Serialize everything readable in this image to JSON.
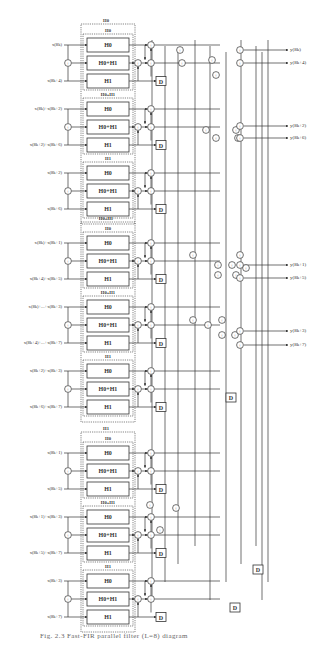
{
  "figure": {
    "caption": "Fig. 2.3   Fast-FIR parallel filter (L=8) diagram",
    "super_groups": [
      {
        "label": "H0",
        "sub_groups": [
          {
            "label": "H0",
            "inputs": [
              "x(8k)",
              "x(8k+4)"
            ],
            "boxes": [
              "H0",
              "H0+H1",
              "H1"
            ]
          },
          {
            "label": "H0+H1",
            "inputs": [
              "x(8k)+x(8k+2)",
              "x(8k+2)+x(8k+6)"
            ],
            "boxes": [
              "H0",
              "H0+H1",
              "H1"
            ]
          },
          {
            "label": "H1",
            "inputs": [
              "x(8k+2)",
              "x(8k+6)"
            ],
            "boxes": [
              "H0",
              "H0+H1",
              "H1"
            ]
          }
        ]
      },
      {
        "label": "H0+H1",
        "sub_groups": [
          {
            "label": "H0",
            "inputs": [
              "x(8k)+x(8k+1)",
              "x(8k+4)+x(8k+5)"
            ],
            "boxes": [
              "H0",
              "H0+H1",
              "H1"
            ]
          },
          {
            "label": "H0+H1",
            "inputs": [
              "x(8k)+...+x(8k+3)",
              "x(8k+4)+...+x(8k+7)"
            ],
            "boxes": [
              "H0",
              "H0+H1",
              "H1"
            ]
          },
          {
            "label": "H1",
            "inputs": [
              "x(8k+2)+x(8k+3)",
              "x(8k+6)+x(8k+7)"
            ],
            "boxes": [
              "H0",
              "H0+H1",
              "H1"
            ]
          }
        ]
      },
      {
        "label": "H1",
        "sub_groups": [
          {
            "label": "H0",
            "inputs": [
              "x(8k+1)",
              "x(8k+5)"
            ],
            "boxes": [
              "H0",
              "H0+H1",
              "H1"
            ]
          },
          {
            "label": "H0+H1",
            "inputs": [
              "x(8k+1)+x(8k+3)",
              "x(8k+5)+x(8k+7)"
            ],
            "boxes": [
              "H0",
              "H0+H1",
              "H1"
            ]
          },
          {
            "label": "H1",
            "inputs": [
              "x(8k+3)",
              "x(8k+7)"
            ],
            "boxes": [
              "H0",
              "H0+H1",
              "H1"
            ]
          }
        ]
      }
    ],
    "outputs": [
      "y(8k)",
      "y(8k+4)",
      "y(8k+2)",
      "y(8k+6)",
      "y(8k+1)",
      "y(8k+5)",
      "y(8k+3)",
      "y(8k+7)"
    ],
    "delay_label": "D",
    "adder_symbol": "+"
  }
}
